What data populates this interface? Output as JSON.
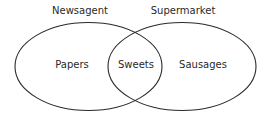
{
  "diagram": {
    "type": "venn",
    "sets": [
      {
        "title": "Newsagent",
        "only": "Papers"
      },
      {
        "title": "Supermarket",
        "only": "Sausages"
      }
    ],
    "intersection": "Sweets",
    "colors": {
      "stroke": "#2a2a2a",
      "background": "#ffffff",
      "text": "#2a2a2a"
    }
  }
}
